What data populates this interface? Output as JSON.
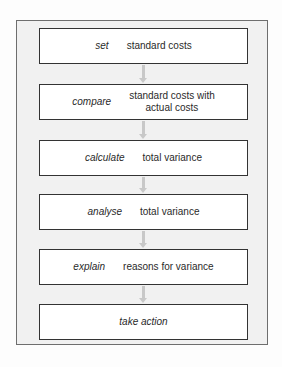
{
  "diagram": {
    "type": "flowchart",
    "direction": "top-to-bottom",
    "steps": [
      {
        "verb": "set",
        "description": "standard costs"
      },
      {
        "verb": "compare",
        "description": "standard costs with actual costs",
        "description_lines": [
          "standard costs with",
          "actual costs"
        ]
      },
      {
        "verb": "calculate",
        "description": "total variance"
      },
      {
        "verb": "analyse",
        "description": "total variance"
      },
      {
        "verb": "explain",
        "description": "reasons for variance"
      },
      {
        "verb": "take action",
        "description": ""
      }
    ],
    "connectors": [
      {
        "from": 0,
        "to": 1
      },
      {
        "from": 1,
        "to": 2
      },
      {
        "from": 2,
        "to": 3
      },
      {
        "from": 3,
        "to": 4
      },
      {
        "from": 4,
        "to": 5
      }
    ],
    "colors": {
      "frame_background": "#f1f1f1",
      "frame_border": "#6e6e6e",
      "box_background": "#ffffff",
      "box_border": "#333333",
      "arrow": "#c8c8c8",
      "text": "#2a2a2a"
    }
  }
}
